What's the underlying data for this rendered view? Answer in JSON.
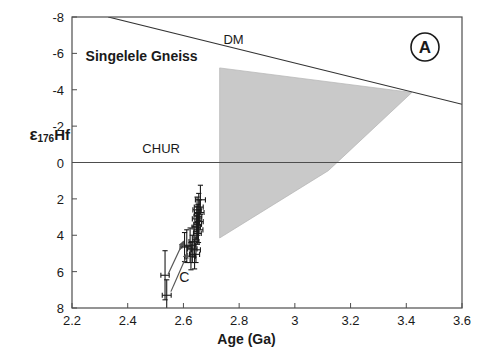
{
  "figure": {
    "panel_label": "A",
    "annotation_title": "Singelele Gneiss",
    "dm_label": "DM",
    "chur_label": "CHUR",
    "arrow_label": "C"
  },
  "axes": {
    "xlabel": "Age (Ga)",
    "ylabel_epsilon": "ε",
    "ylabel_sub": "176",
    "ylabel_element": "Hf",
    "xticks": [
      "2.2",
      "2.4",
      "2.6",
      "2.8",
      "3",
      "3.2",
      "3.4",
      "3.6"
    ],
    "yticks": [
      "8",
      "6",
      "4",
      "2",
      "0",
      "-2",
      "-4",
      "-6",
      "-8"
    ]
  },
  "colors": {
    "axis": "#4d4d4d",
    "text": "#1a1a1a",
    "band_fill": "#c9c9c9",
    "band_stroke": "#b3b3b3",
    "marker": "#1a1a1a",
    "arrow": "#555555"
  },
  "chart_data": {
    "type": "scatter",
    "title": "Singelele Gneiss",
    "panel": "A",
    "xlabel": "Age (Ga)",
    "ylabel": "ε176Hf",
    "xlim": [
      2.2,
      3.6
    ],
    "ylim": [
      -8,
      8
    ],
    "xticks": [
      2.2,
      2.4,
      2.6,
      2.8,
      3.0,
      3.2,
      3.4,
      3.6
    ],
    "yticks": [
      -8,
      -6,
      -4,
      -2,
      0,
      2,
      4,
      6,
      8
    ],
    "grid": false,
    "legend": "none",
    "reference_lines": [
      {
        "name": "DM",
        "label": "DM",
        "type": "line",
        "points": [
          [
            2.33,
            8.0
          ],
          [
            3.6,
            3.2
          ]
        ],
        "label_position": [
          2.78,
          6.75
        ]
      },
      {
        "name": "CHUR",
        "label": "CHUR",
        "type": "horizontal",
        "y": 0,
        "label_position": [
          2.52,
          0.75
        ]
      }
    ],
    "shaded_band": {
      "name": "crustal-evolution-array",
      "type": "polygon",
      "fill": "#c9c9c9",
      "points": [
        [
          2.73,
          5.2
        ],
        [
          3.42,
          3.85
        ],
        [
          3.12,
          -0.45
        ],
        [
          2.73,
          -4.15
        ]
      ]
    },
    "annotations": [
      {
        "text": "C",
        "position": [
          2.585,
          -6.55
        ]
      },
      {
        "type": "arrow",
        "from": [
          2.545,
          -6.15
        ],
        "to": [
          2.6,
          -4.35
        ]
      },
      {
        "type": "arrow",
        "from": [
          2.555,
          -7.1
        ],
        "to": [
          2.615,
          -5.0
        ]
      }
    ],
    "series": [
      {
        "name": "Singelele Gneiss zircon analyses",
        "marker": "cross-with-error-bars",
        "points": [
          {
            "x": 2.661,
            "y": -2.05,
            "xerr": 0.018,
            "yerr": 0.8
          },
          {
            "x": 2.655,
            "y": -2.45,
            "xerr": 0.016,
            "yerr": 0.75
          },
          {
            "x": 2.649,
            "y": -2.6,
            "xerr": 0.015,
            "yerr": 0.7
          },
          {
            "x": 2.657,
            "y": -2.75,
            "xerr": 0.017,
            "yerr": 0.7
          },
          {
            "x": 2.652,
            "y": -2.95,
            "xerr": 0.014,
            "yerr": 0.65
          },
          {
            "x": 2.648,
            "y": -3.1,
            "xerr": 0.016,
            "yerr": 0.7
          },
          {
            "x": 2.656,
            "y": -3.25,
            "xerr": 0.015,
            "yerr": 0.65
          },
          {
            "x": 2.651,
            "y": -3.4,
            "xerr": 0.014,
            "yerr": 0.6
          },
          {
            "x": 2.646,
            "y": -3.55,
            "xerr": 0.015,
            "yerr": 0.65
          },
          {
            "x": 2.654,
            "y": -3.7,
            "xerr": 0.016,
            "yerr": 0.7
          },
          {
            "x": 2.65,
            "y": -3.9,
            "xerr": 0.014,
            "yerr": 0.6
          },
          {
            "x": 2.638,
            "y": -4.35,
            "xerr": 0.018,
            "yerr": 0.85
          },
          {
            "x": 2.624,
            "y": -4.55,
            "xerr": 0.02,
            "yerr": 0.95
          },
          {
            "x": 2.612,
            "y": -4.6,
            "xerr": 0.018,
            "yerr": 0.9
          },
          {
            "x": 2.604,
            "y": -4.65,
            "xerr": 0.016,
            "yerr": 0.8
          },
          {
            "x": 2.632,
            "y": -4.75,
            "xerr": 0.017,
            "yerr": 0.75
          },
          {
            "x": 2.645,
            "y": -4.8,
            "xerr": 0.016,
            "yerr": 0.7
          },
          {
            "x": 2.64,
            "y": -5.05,
            "xerr": 0.018,
            "yerr": 0.8
          },
          {
            "x": 2.627,
            "y": -5.15,
            "xerr": 0.016,
            "yerr": 0.75
          },
          {
            "x": 2.534,
            "y": -6.2,
            "xerr": 0.015,
            "yerr": 1.35
          },
          {
            "x": 2.54,
            "y": -7.3,
            "xerr": 0.016,
            "yerr": 0.85
          }
        ]
      }
    ]
  }
}
